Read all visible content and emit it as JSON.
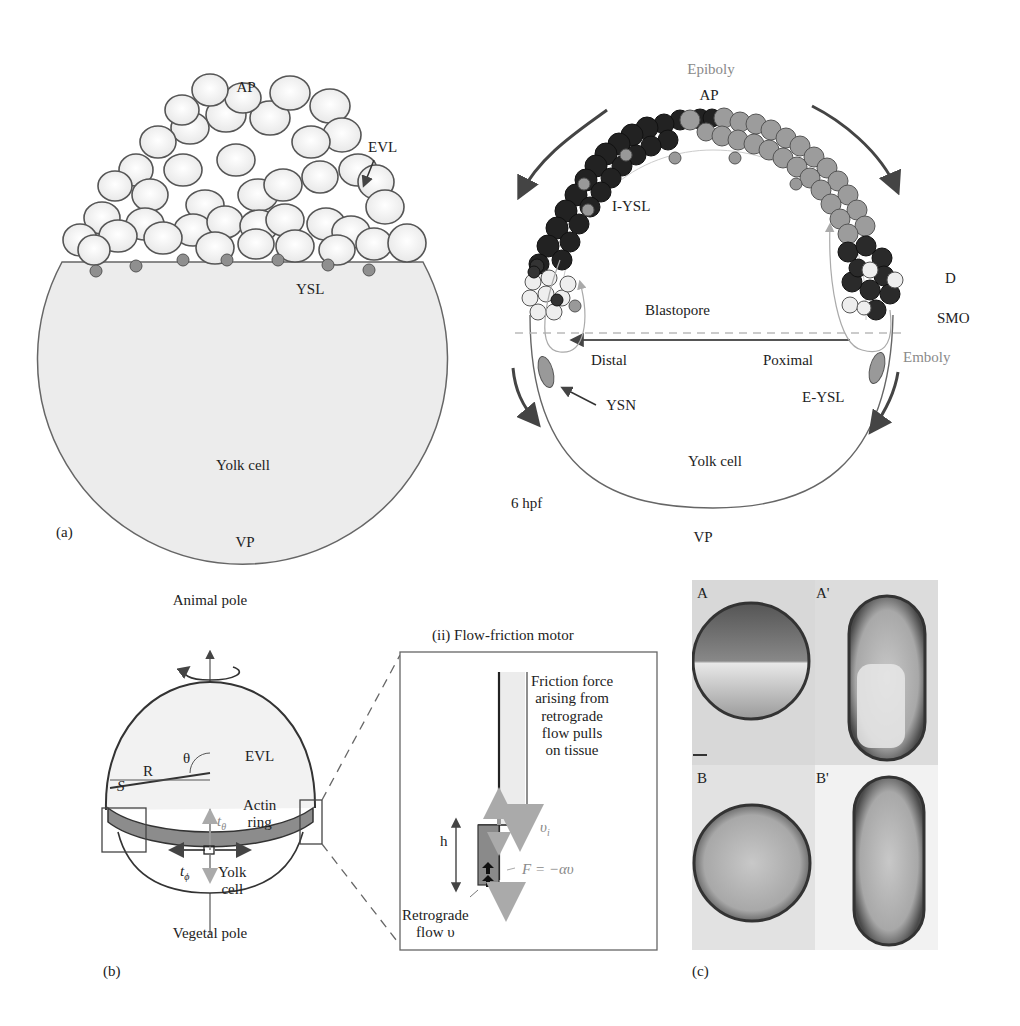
{
  "figure": {
    "panel_a": {
      "panel_label": "(a)",
      "left": {
        "ap": "AP",
        "evl": "EVL",
        "ysl": "YSL",
        "yolk_cell": "Yolk cell",
        "vp": "VP"
      },
      "right": {
        "epiboly": "Epiboly",
        "ap": "AP",
        "i_ysl": "I-YSL",
        "d": "D",
        "smo": "SMO",
        "blastopore": "Blastopore",
        "distal": "Distal",
        "proximal": "Poximal",
        "emboly": "Emboly",
        "ysn": "YSN",
        "e_ysl": "E-YSL",
        "yolk_cell": "Yolk cell",
        "stage": "6 hpf",
        "vp": "VP"
      }
    },
    "panel_b": {
      "panel_label": "(b)",
      "sphere": {
        "animal_pole": "Animal pole",
        "vegetal_pole": "Vegetal pole",
        "theta": "θ",
        "evl": "EVL",
        "r": "R",
        "s": "S",
        "actin_ring": "Actin\nring",
        "t_theta": "t",
        "t_theta_sub": "θ",
        "t_phi": "t",
        "t_phi_sub": "ϕ",
        "yolk_cell": "Yolk\ncell"
      },
      "motor": {
        "title": "(ii) Flow-friction motor",
        "friction_text": "Friction force\narising from\nretrograde\nflow pulls\non tissue",
        "v_i": "υ",
        "v_i_sub": "i",
        "h": "h",
        "force_eq": "F = −αυ",
        "retro_flow": "Retrograde\nflow υ"
      }
    },
    "panel_c": {
      "panel_label": "(c)",
      "images": [
        {
          "label": "A"
        },
        {
          "label": "A'"
        },
        {
          "label": "B"
        },
        {
          "label": "B'"
        }
      ]
    },
    "colors": {
      "line": "#555555",
      "yolk_fill": "#ededed",
      "cell_fill": "#f7f7f7",
      "dark_cell": "#2a2a2a",
      "gray_cell": "#9a9a9a",
      "accent_gray": "#8a8a8a",
      "actin_ring": "#8c8c8c"
    }
  }
}
